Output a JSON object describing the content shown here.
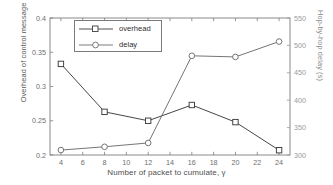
{
  "chart_data": {
    "type": "line",
    "title": "",
    "xlabel": "Number of packet to cumulate, γ",
    "x": [
      4,
      8,
      12,
      16,
      20,
      24
    ],
    "xticks": [
      4,
      6,
      8,
      10,
      12,
      14,
      16,
      18,
      20,
      22,
      24
    ],
    "xlim": [
      3,
      25
    ],
    "grid": false,
    "legend_position": "upper-left-inside",
    "axes": [
      {
        "id": "left",
        "ylabel": "Overhead of control message (%)",
        "ylim": [
          0.2,
          0.4
        ],
        "yticks": [
          0.2,
          0.25,
          0.3,
          0.35,
          0.4
        ],
        "yticklabels": [
          "0.2",
          "0.25",
          "0.3",
          "0.35",
          "0.4"
        ]
      },
      {
        "id": "right",
        "ylabel": "Hop-by-hop delay (s)",
        "ylim": [
          300,
          550
        ],
        "yticks": [
          300,
          350,
          400,
          450,
          500,
          550
        ],
        "yticklabels": [
          "300",
          "350",
          "400",
          "450",
          "500",
          "550"
        ]
      }
    ],
    "series": [
      {
        "name": "overhead",
        "axis": "left",
        "marker": "square",
        "color": "#3c3c3c",
        "values": [
          0.333,
          0.263,
          0.25,
          0.273,
          0.248,
          0.207
        ]
      },
      {
        "name": "delay",
        "axis": "right",
        "marker": "circle",
        "color": "#6e6e6e",
        "values": [
          309,
          315,
          322,
          481,
          479,
          507
        ]
      }
    ],
    "legend": [
      {
        "label": "overhead",
        "marker": "square"
      },
      {
        "label": "delay",
        "marker": "circle"
      }
    ]
  }
}
